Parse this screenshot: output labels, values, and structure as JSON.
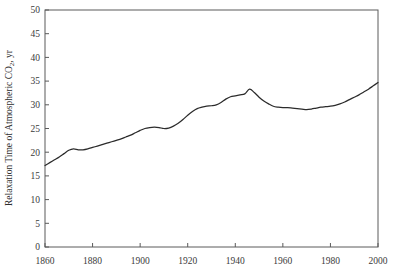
{
  "chart_data": {
    "type": "line",
    "title": "",
    "xlabel": "",
    "ylabel": "Relaxation Time of Atmospheric CO2, yr",
    "ylabel_parts": {
      "before": "Relaxation Time of Atmospheric CO",
      "subscript": "2",
      "after": ", yr"
    },
    "xlim": [
      1860,
      2000
    ],
    "ylim": [
      0,
      50
    ],
    "grid": false,
    "legend": null,
    "xticks": [
      1860,
      1880,
      1900,
      1920,
      1940,
      1960,
      1980,
      2000
    ],
    "xtick_labels": [
      "1860",
      "1880",
      "1900",
      "1920",
      "1940",
      "1960",
      "1980",
      "2000"
    ],
    "yticks": [
      0,
      5,
      10,
      15,
      20,
      25,
      30,
      35,
      40,
      45,
      50
    ],
    "ytick_labels": [
      "0",
      "5",
      "10",
      "15",
      "20",
      "25",
      "30",
      "35",
      "40",
      "45",
      "50"
    ],
    "line_color": "#2b2b2b",
    "axis_color": "#5a5a5a",
    "series": [
      {
        "name": "Relaxation Time of Atmospheric CO2",
        "x": [
          1860,
          1862,
          1864,
          1866,
          1868,
          1870,
          1872,
          1874,
          1876,
          1878,
          1880,
          1882,
          1884,
          1886,
          1888,
          1890,
          1892,
          1894,
          1896,
          1898,
          1900,
          1902,
          1904,
          1906,
          1908,
          1910,
          1912,
          1914,
          1916,
          1918,
          1920,
          1922,
          1924,
          1926,
          1928,
          1930,
          1932,
          1934,
          1936,
          1938,
          1940,
          1942,
          1944,
          1946,
          1948,
          1950,
          1952,
          1954,
          1956,
          1958,
          1960,
          1962,
          1964,
          1966,
          1968,
          1970,
          1972,
          1974,
          1976,
          1978,
          1980,
          1982,
          1984,
          1986,
          1988,
          1990,
          1992,
          1994,
          1996,
          1998,
          2000
        ],
        "y": [
          17.2,
          17.8,
          18.4,
          19.0,
          19.7,
          20.4,
          20.7,
          20.5,
          20.5,
          20.7,
          21.0,
          21.3,
          21.6,
          21.9,
          22.2,
          22.5,
          22.8,
          23.2,
          23.6,
          24.1,
          24.6,
          25.0,
          25.2,
          25.3,
          25.2,
          25.0,
          25.1,
          25.5,
          26.1,
          26.9,
          27.8,
          28.6,
          29.2,
          29.5,
          29.7,
          29.8,
          30.0,
          30.5,
          31.2,
          31.7,
          31.9,
          32.1,
          32.3,
          33.3,
          32.6,
          31.6,
          30.8,
          30.2,
          29.7,
          29.5,
          29.4,
          29.4,
          29.3,
          29.2,
          29.1,
          29.0,
          29.1,
          29.3,
          29.5,
          29.6,
          29.7,
          29.9,
          30.2,
          30.6,
          31.1,
          31.6,
          32.1,
          32.7,
          33.3,
          34.0,
          34.7
        ]
      }
    ],
    "plot_area": {
      "left_px": 45,
      "right_px": 378,
      "top_px": 10,
      "bottom_px": 247
    }
  }
}
